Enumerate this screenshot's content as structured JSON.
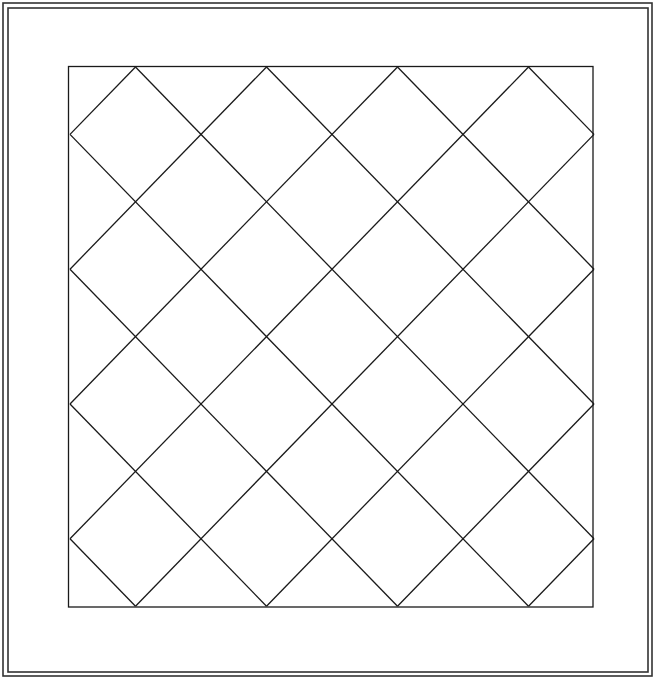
{
  "diagram": {
    "type": "quilt-pattern",
    "width": 656,
    "height": 680,
    "colors": {
      "background": "#ffffff",
      "line": "#1a1a1a",
      "border": "#333333"
    },
    "outer_border": {
      "outer": {
        "x": 3,
        "y": 3,
        "w": 649,
        "h": 673
      },
      "inner": {
        "x": 8,
        "y": 8,
        "w": 640,
        "h": 664
      }
    },
    "inner_panel": {
      "x": 68.5,
      "y": 66.5,
      "w": 524.5,
      "h": 540.5
    },
    "diamond_grid": {
      "columns": 4,
      "rows": 4,
      "origin_x": 70,
      "origin_y": 67,
      "half_width": 65.5,
      "half_height": 67.4,
      "top_vertices_x": [
        135,
        265,
        395,
        525
      ],
      "side_vertices_y": [
        135,
        270,
        405,
        540
      ]
    }
  }
}
